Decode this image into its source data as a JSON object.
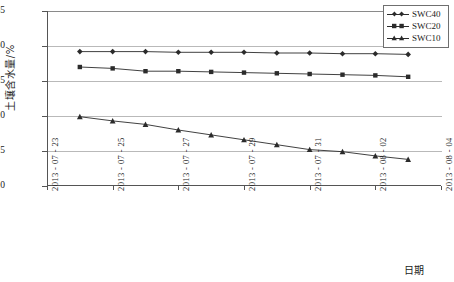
{
  "chart_data": {
    "type": "line",
    "title": "",
    "xlabel": "日期",
    "ylabel": "土壤含水量/%",
    "ylim": [
      10,
      35
    ],
    "yticks": [
      10,
      15,
      20,
      25,
      30,
      35
    ],
    "ytick_labels": [
      "10",
      "15",
      "20",
      "25",
      "30",
      "35"
    ],
    "grid": true,
    "legend_position": "top-right",
    "x": [
      "2013-07-24",
      "2013-07-25",
      "2013-07-26",
      "2013-07-27",
      "2013-07-28",
      "2013-07-29",
      "2013-07-30",
      "2013-07-31",
      "2013-08-01",
      "2013-08-02",
      "2013-08-03"
    ],
    "xticks": [
      "2013 - 07 - 23",
      "2013 - 07 - 25",
      "2013 - 07 - 27",
      "2013 - 07 - 29",
      "2013 - 07 - 31",
      "2013 - 08 - 02",
      "2013 - 08 - 04"
    ],
    "xlim": [
      "2013-07-23",
      "2013-08-04"
    ],
    "series": [
      {
        "name": "SWC40",
        "marker": "diamond",
        "color": "#2b2b2b",
        "values": [
          29.2,
          29.2,
          29.2,
          29.1,
          29.1,
          29.1,
          29.0,
          29.0,
          28.9,
          28.9,
          28.8
        ]
      },
      {
        "name": "SWC20",
        "marker": "square",
        "color": "#2b2b2b",
        "values": [
          27.0,
          26.8,
          26.4,
          26.4,
          26.3,
          26.2,
          26.1,
          26.0,
          25.9,
          25.8,
          25.6
        ]
      },
      {
        "name": "SWC10",
        "marker": "triangle",
        "color": "#2b2b2b",
        "values": [
          19.9,
          19.3,
          18.8,
          18.0,
          17.3,
          16.6,
          15.9,
          15.2,
          14.9,
          14.3,
          13.8
        ]
      }
    ]
  },
  "legend": {
    "items": [
      {
        "label": "SWC40",
        "marker": "diamond"
      },
      {
        "label": "SWC20",
        "marker": "square"
      },
      {
        "label": "SWC10",
        "marker": "triangle"
      }
    ]
  }
}
